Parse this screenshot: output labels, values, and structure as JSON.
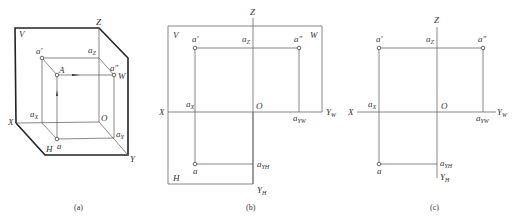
{
  "figure": {
    "panels": [
      {
        "id": "a",
        "caption": "(a)",
        "labels": {
          "V": "V",
          "Z": "Z",
          "W": "W",
          "X": "X",
          "Y": "Y",
          "H": "H",
          "O": "O",
          "A": "A",
          "a_prime": "a'",
          "a_dprime": "a\"",
          "a": "a",
          "a_z": "a",
          "a_z_sub": "Z",
          "a_x": "a",
          "a_x_sub": "X",
          "a_y": "a",
          "a_y_sub": "Y"
        }
      },
      {
        "id": "b",
        "caption": "(b)",
        "labels": {
          "V": "V",
          "W": "W",
          "H": "H",
          "Z": "Z",
          "X": "X",
          "O": "O",
          "Y_W": "Y",
          "Y_W_sub": "W",
          "Y_H": "Y",
          "Y_H_sub": "H",
          "a_prime": "a'",
          "a_dprime": "a\"",
          "a": "a",
          "a_z": "a",
          "a_z_sub": "Z",
          "a_x": "a",
          "a_x_sub": "X",
          "a_yw": "a",
          "a_yw_sub": "YW",
          "a_yh": "a",
          "a_yh_sub": "YH"
        }
      },
      {
        "id": "c",
        "caption": "(c)",
        "labels": {
          "Z": "Z",
          "X": "X",
          "O": "O",
          "Y_W": "Y",
          "Y_W_sub": "W",
          "Y_H": "Y",
          "Y_H_sub": "H",
          "a_prime": "a'",
          "a_dprime": "a\"",
          "a": "a",
          "a_z": "a",
          "a_z_sub": "Z",
          "a_x": "a",
          "a_x_sub": "X",
          "a_yw": "a",
          "a_yw_sub": "YW",
          "a_yh": "a",
          "a_yh_sub": "YH"
        }
      }
    ]
  }
}
